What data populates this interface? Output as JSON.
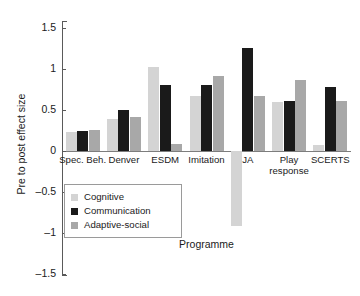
{
  "chart_data": {
    "type": "bar",
    "title": "",
    "xlabel": "Programme",
    "ylabel": "Pre to post effect size",
    "ylim": [
      -1.5,
      1.5
    ],
    "yticks": [
      "1.5",
      "1",
      "0.5",
      "0",
      "-0.5",
      "-1",
      "-1.5"
    ],
    "ytick_values": [
      1.5,
      1,
      0.5,
      0,
      -0.5,
      -1,
      -1.5
    ],
    "grid": false,
    "legend_position": "inside-lower-left",
    "categories": [
      "Spec. Beh.",
      "Denver",
      "ESDM",
      "Imitation",
      "JA",
      "Play response",
      "SCERTS"
    ],
    "series": [
      {
        "name": "Cognitive",
        "color": "#d4d4d4",
        "values": [
          0.23,
          0.39,
          1.03,
          0.67,
          -0.92,
          0.6,
          0.07
        ]
      },
      {
        "name": "Communication",
        "color": "#1a1a1a",
        "values": [
          0.24,
          0.5,
          0.8,
          0.8,
          1.26,
          0.61,
          0.78
        ]
      },
      {
        "name": "Adaptive-social",
        "color": "#a8a8a8",
        "values": [
          0.26,
          0.41,
          0.08,
          0.91,
          0.67,
          0.86,
          0.61
        ]
      }
    ]
  }
}
